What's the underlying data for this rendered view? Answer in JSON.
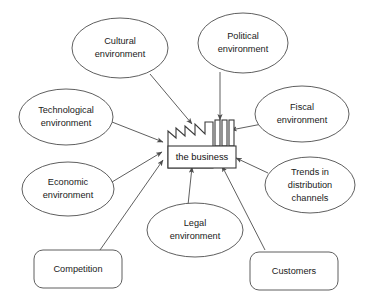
{
  "diagram": {
    "style": {
      "background": "#ffffff",
      "stroke": "#4d4d4d",
      "text": "#1a1a1a"
    },
    "center": {
      "label": "the business",
      "shape": "factory"
    },
    "nodes": [
      {
        "id": "cultural",
        "shape": "ellipse",
        "lines": [
          "Cultural",
          "environment"
        ],
        "line1": "Cultural",
        "line2": "environment",
        "line3": ""
      },
      {
        "id": "political",
        "shape": "ellipse",
        "lines": [
          "Political",
          "environment"
        ],
        "line1": "Political",
        "line2": "environment",
        "line3": ""
      },
      {
        "id": "technological",
        "shape": "ellipse",
        "lines": [
          "Technological",
          "environment"
        ],
        "line1": "Technological",
        "line2": "environment",
        "line3": ""
      },
      {
        "id": "fiscal",
        "shape": "ellipse",
        "lines": [
          "Fiscal",
          "environment"
        ],
        "line1": "Fiscal",
        "line2": "environment",
        "line3": ""
      },
      {
        "id": "economic",
        "shape": "ellipse",
        "lines": [
          "Economic",
          "environment"
        ],
        "line1": "Economic",
        "line2": "environment",
        "line3": ""
      },
      {
        "id": "trends",
        "shape": "ellipse",
        "lines": [
          "Trends in",
          "distribution",
          "channels"
        ],
        "line1": "Trends in",
        "line2": "distribution",
        "line3": "channels"
      },
      {
        "id": "legal",
        "shape": "ellipse",
        "lines": [
          "Legal",
          "environment"
        ],
        "line1": "Legal",
        "line2": "environment",
        "line3": ""
      },
      {
        "id": "competition",
        "shape": "rounded-rect",
        "lines": [
          "Competition"
        ],
        "line1": "Competition",
        "line2": "",
        "line3": ""
      },
      {
        "id": "customers",
        "shape": "rounded-rect",
        "lines": [
          "Customers"
        ],
        "line1": "Customers",
        "line2": "",
        "line3": ""
      }
    ],
    "edges": [
      {
        "from": "cultural",
        "to": "center",
        "arrow": "to-center"
      },
      {
        "from": "political",
        "to": "center",
        "arrow": "to-center"
      },
      {
        "from": "technological",
        "to": "center",
        "arrow": "to-center"
      },
      {
        "from": "fiscal",
        "to": "center",
        "arrow": "to-center"
      },
      {
        "from": "economic",
        "to": "center",
        "arrow": "to-center"
      },
      {
        "from": "trends",
        "to": "center",
        "arrow": "to-center"
      },
      {
        "from": "legal",
        "to": "center",
        "arrow": "to-center"
      },
      {
        "from": "competition",
        "to": "center",
        "arrow": "to-center"
      },
      {
        "from": "customers",
        "to": "center",
        "arrow": "to-center"
      }
    ]
  }
}
